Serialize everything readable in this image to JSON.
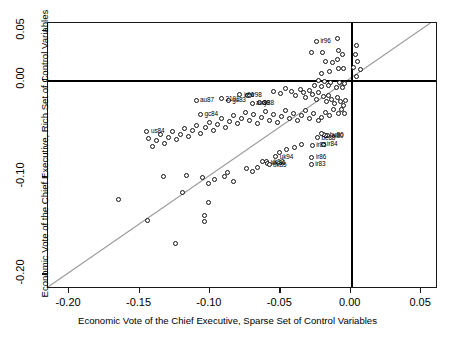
{
  "chart_data": {
    "type": "scatter",
    "title": "",
    "xlabel": "Economic Vote of the Chief Executive, Sparse Set of Control Variables",
    "ylabel": "Economic Vote of the Chief Executive, Rich Set of Control Variables",
    "xlim": [
      -0.215,
      0.062
    ],
    "ylim": [
      -0.215,
      0.058
    ],
    "xticks": [
      -0.2,
      -0.15,
      -0.1,
      -0.05,
      0.0,
      0.05
    ],
    "xticklabels": [
      "-0.20",
      "-0.15",
      "-0.10",
      "-0.05",
      "0.00",
      "0.05"
    ],
    "yticks": [
      0.05,
      0.0,
      -0.1,
      -0.2
    ],
    "yticklabels": [
      "0.05",
      "0.00",
      "-0.10",
      "-0.20"
    ],
    "grid": false,
    "legend": null,
    "marker": "open-circle",
    "reference_lines": [
      {
        "name": "y-zero",
        "type": "horizontal",
        "value": 0.0,
        "style": "bold-black"
      },
      {
        "name": "x-zero",
        "type": "vertical",
        "value": 0.0,
        "style": "bold-black"
      },
      {
        "name": "identity",
        "type": "diagonal",
        "equation": "y = x",
        "style": "gray-thin"
      }
    ],
    "points": [
      {
        "x": -0.0243,
        "y": 0.0391,
        "label": "ir96"
      },
      {
        "x": -0.0275,
        "y": 0.0277,
        "label": ""
      },
      {
        "x": -0.0203,
        "y": 0.0277,
        "label": ""
      },
      {
        "x": -0.0182,
        "y": 0.0182,
        "label": ""
      },
      {
        "x": -0.0132,
        "y": 0.0178,
        "label": ""
      },
      {
        "x": -0.0153,
        "y": 0.0082,
        "label": ""
      },
      {
        "x": -0.0211,
        "y": 0.006,
        "label": ""
      },
      {
        "x": -0.0096,
        "y": 0.0422,
        "label": ""
      },
      {
        "x": -0.0089,
        "y": 0.0299,
        "label": ""
      },
      {
        "x": -0.006,
        "y": 0.0256,
        "label": ""
      },
      {
        "x": -0.0092,
        "y": 0.0205,
        "label": ""
      },
      {
        "x": -0.0085,
        "y": 0.0116,
        "label": ""
      },
      {
        "x": -0.005,
        "y": 0.0114,
        "label": ""
      },
      {
        "x": 0.0038,
        "y": 0.035,
        "label": ""
      },
      {
        "x": 0.0035,
        "y": 0.0258,
        "label": ""
      },
      {
        "x": 0.005,
        "y": 0.019,
        "label": ""
      },
      {
        "x": 0.0023,
        "y": 0.0128,
        "label": ""
      },
      {
        "x": 0.0068,
        "y": 0.0106,
        "label": ""
      },
      {
        "x": 0.0042,
        "y": 0.0035,
        "label": ""
      },
      {
        "x": -0.0232,
        "y": -0.0007,
        "label": ""
      },
      {
        "x": -0.0186,
        "y": -0.0022,
        "label": ""
      },
      {
        "x": -0.014,
        "y": -0.003,
        "label": ""
      },
      {
        "x": -0.0079,
        "y": -0.0026,
        "label": ""
      },
      {
        "x": -0.0043,
        "y": -0.0036,
        "label": ""
      },
      {
        "x": -0.0254,
        "y": -0.0062,
        "label": ""
      },
      {
        "x": -0.0204,
        "y": -0.0071,
        "label": ""
      },
      {
        "x": -0.0157,
        "y": -0.0059,
        "label": ""
      },
      {
        "x": -0.0104,
        "y": -0.0083,
        "label": ""
      },
      {
        "x": -0.0057,
        "y": -0.0079,
        "label": ""
      },
      {
        "x": -0.1098,
        "y": -0.0214,
        "label": "au87"
      },
      {
        "x": -0.0917,
        "y": -0.0195,
        "label": "2101"
      },
      {
        "x": -0.0869,
        "y": -0.0213,
        "label": "gc83"
      },
      {
        "x": -0.0787,
        "y": -0.0154,
        "label": "ir96"
      },
      {
        "x": -0.0733,
        "y": -0.0162,
        "label": "ir98"
      },
      {
        "x": -0.0722,
        "y": -0.0165,
        "label": ""
      },
      {
        "x": -0.0701,
        "y": -0.0244,
        "label": "au89"
      },
      {
        "x": -0.0645,
        "y": -0.0238,
        "label": "y88"
      },
      {
        "x": -0.0615,
        "y": -0.0232,
        "label": ""
      },
      {
        "x": -0.1067,
        "y": -0.0354,
        "label": "gc84"
      },
      {
        "x": -0.1447,
        "y": -0.0531,
        "label": "us84"
      },
      {
        "x": -0.0545,
        "y": -0.0118,
        "label": ""
      },
      {
        "x": -0.0496,
        "y": -0.0141,
        "label": ""
      },
      {
        "x": -0.0462,
        "y": -0.0097,
        "label": ""
      },
      {
        "x": -0.0423,
        "y": -0.012,
        "label": ""
      },
      {
        "x": -0.039,
        "y": -0.0162,
        "label": ""
      },
      {
        "x": -0.0358,
        "y": -0.0102,
        "label": ""
      },
      {
        "x": -0.0332,
        "y": -0.0138,
        "label": ""
      },
      {
        "x": -0.0318,
        "y": -0.0183,
        "label": ""
      },
      {
        "x": -0.0296,
        "y": -0.0117,
        "label": ""
      },
      {
        "x": -0.0268,
        "y": -0.0155,
        "label": ""
      },
      {
        "x": -0.0243,
        "y": -0.0201,
        "label": ""
      },
      {
        "x": -0.0228,
        "y": -0.0136,
        "label": ""
      },
      {
        "x": -0.0196,
        "y": -0.0178,
        "label": ""
      },
      {
        "x": -0.0174,
        "y": -0.0225,
        "label": ""
      },
      {
        "x": -0.0158,
        "y": -0.016,
        "label": ""
      },
      {
        "x": -0.0134,
        "y": -0.0203,
        "label": ""
      },
      {
        "x": -0.0112,
        "y": -0.0249,
        "label": ""
      },
      {
        "x": -0.0095,
        "y": -0.0187,
        "label": ""
      },
      {
        "x": -0.0073,
        "y": -0.0229,
        "label": ""
      },
      {
        "x": -0.0052,
        "y": -0.0271,
        "label": ""
      },
      {
        "x": -0.0035,
        "y": -0.0213,
        "label": ""
      },
      {
        "x": -0.012,
        "y": -0.031,
        "label": ""
      },
      {
        "x": -0.009,
        "y": -0.0348,
        "label": ""
      },
      {
        "x": -0.0063,
        "y": -0.0305,
        "label": ""
      },
      {
        "x": -0.0041,
        "y": -0.0345,
        "label": ""
      },
      {
        "x": -0.0153,
        "y": -0.0374,
        "label": ""
      },
      {
        "x": -0.0181,
        "y": -0.034,
        "label": ""
      },
      {
        "x": -0.0205,
        "y": -0.0386,
        "label": ""
      },
      {
        "x": -0.0232,
        "y": -0.042,
        "label": ""
      },
      {
        "x": -0.0266,
        "y": -0.0353,
        "label": ""
      },
      {
        "x": -0.0295,
        "y": -0.0397,
        "label": ""
      },
      {
        "x": -0.0322,
        "y": -0.0315,
        "label": ""
      },
      {
        "x": -0.035,
        "y": -0.0366,
        "label": ""
      },
      {
        "x": -0.0378,
        "y": -0.0425,
        "label": ""
      },
      {
        "x": -0.0408,
        "y": -0.0347,
        "label": ""
      },
      {
        "x": -0.0436,
        "y": -0.0402,
        "label": ""
      },
      {
        "x": -0.0464,
        "y": -0.0318,
        "label": ""
      },
      {
        "x": -0.049,
        "y": -0.0379,
        "label": ""
      },
      {
        "x": -0.0518,
        "y": -0.0438,
        "label": ""
      },
      {
        "x": -0.0548,
        "y": -0.0356,
        "label": ""
      },
      {
        "x": -0.0576,
        "y": -0.0416,
        "label": ""
      },
      {
        "x": -0.0604,
        "y": -0.0332,
        "label": ""
      },
      {
        "x": -0.0634,
        "y": -0.039,
        "label": ""
      },
      {
        "x": -0.0662,
        "y": -0.0448,
        "label": ""
      },
      {
        "x": -0.069,
        "y": -0.0364,
        "label": ""
      },
      {
        "x": -0.0718,
        "y": -0.0424,
        "label": ""
      },
      {
        "x": -0.0748,
        "y": -0.034,
        "label": ""
      },
      {
        "x": -0.0776,
        "y": -0.0398,
        "label": ""
      },
      {
        "x": -0.0806,
        "y": -0.0455,
        "label": ""
      },
      {
        "x": -0.0834,
        "y": -0.0372,
        "label": ""
      },
      {
        "x": -0.0862,
        "y": -0.043,
        "label": ""
      },
      {
        "x": -0.0892,
        "y": -0.0488,
        "label": ""
      },
      {
        "x": -0.092,
        "y": -0.0405,
        "label": ""
      },
      {
        "x": -0.0948,
        "y": -0.0462,
        "label": ""
      },
      {
        "x": -0.0978,
        "y": -0.052,
        "label": ""
      },
      {
        "x": -0.1006,
        "y": -0.0437,
        "label": ""
      },
      {
        "x": -0.1034,
        "y": -0.0495,
        "label": ""
      },
      {
        "x": -0.1064,
        "y": -0.0553,
        "label": ""
      },
      {
        "x": -0.1092,
        "y": -0.047,
        "label": ""
      },
      {
        "x": -0.1122,
        "y": -0.0528,
        "label": ""
      },
      {
        "x": -0.115,
        "y": -0.0586,
        "label": ""
      },
      {
        "x": -0.1178,
        "y": -0.0503,
        "label": ""
      },
      {
        "x": -0.1208,
        "y": -0.0561,
        "label": ""
      },
      {
        "x": -0.1236,
        "y": -0.0619,
        "label": ""
      },
      {
        "x": -0.1264,
        "y": -0.0536,
        "label": ""
      },
      {
        "x": -0.1294,
        "y": -0.0594,
        "label": ""
      },
      {
        "x": -0.1322,
        "y": -0.0652,
        "label": ""
      },
      {
        "x": -0.135,
        "y": -0.0569,
        "label": ""
      },
      {
        "x": -0.138,
        "y": -0.0627,
        "label": ""
      },
      {
        "x": -0.1408,
        "y": -0.0685,
        "label": ""
      },
      {
        "x": -0.1436,
        "y": -0.0602,
        "label": ""
      },
      {
        "x": -0.0236,
        "y": -0.0598,
        "label": "be88"
      },
      {
        "x": -0.0162,
        "y": -0.0576,
        "label": "nl80"
      },
      {
        "x": -0.0178,
        "y": -0.057,
        "label": "bu80"
      },
      {
        "x": -0.0196,
        "y": -0.0563,
        "label": ""
      },
      {
        "x": -0.0209,
        "y": -0.0556,
        "label": ""
      },
      {
        "x": -0.0274,
        "y": -0.0676,
        "label": "ir85"
      },
      {
        "x": -0.0196,
        "y": -0.0663,
        "label": "ir84"
      },
      {
        "x": -0.0275,
        "y": -0.08,
        "label": "ir86"
      },
      {
        "x": -0.0281,
        "y": -0.0871,
        "label": "ir83"
      },
      {
        "x": -0.0532,
        "y": -0.0795,
        "label": "uk94"
      },
      {
        "x": -0.0625,
        "y": -0.0838,
        "label": ""
      },
      {
        "x": -0.0597,
        "y": -0.0846,
        "label": "uk92"
      },
      {
        "x": -0.0588,
        "y": -0.086,
        "label": "uk86"
      },
      {
        "x": -0.058,
        "y": -0.0873,
        "label": "uk85"
      },
      {
        "x": -0.0835,
        "y": -0.1044,
        "label": ""
      },
      {
        "x": -0.0899,
        "y": -0.1,
        "label": ""
      },
      {
        "x": -0.0873,
        "y": -0.0958,
        "label": ""
      },
      {
        "x": -0.101,
        "y": -0.107,
        "label": ""
      },
      {
        "x": -0.0965,
        "y": -0.1023,
        "label": ""
      },
      {
        "x": -0.1055,
        "y": -0.1004,
        "label": ""
      },
      {
        "x": -0.1165,
        "y": -0.099,
        "label": ""
      },
      {
        "x": -0.133,
        "y": -0.0998,
        "label": ""
      },
      {
        "x": -0.1196,
        "y": -0.1163,
        "label": ""
      },
      {
        "x": -0.165,
        "y": -0.1232,
        "label": ""
      },
      {
        "x": -0.1443,
        "y": -0.1445,
        "label": ""
      },
      {
        "x": -0.1007,
        "y": -0.1265,
        "label": ""
      },
      {
        "x": -0.1035,
        "y": -0.1395,
        "label": ""
      },
      {
        "x": -0.1042,
        "y": -0.146,
        "label": ""
      },
      {
        "x": -0.1245,
        "y": -0.1682,
        "label": ""
      },
      {
        "x": -0.0698,
        "y": -0.0942,
        "label": ""
      },
      {
        "x": -0.0742,
        "y": -0.0912,
        "label": ""
      },
      {
        "x": -0.066,
        "y": -0.09,
        "label": ""
      },
      {
        "x": -0.0455,
        "y": -0.0718,
        "label": ""
      },
      {
        "x": -0.0503,
        "y": -0.0745,
        "label": ""
      },
      {
        "x": -0.0398,
        "y": -0.0702,
        "label": ""
      },
      {
        "x": -0.0352,
        "y": -0.067,
        "label": ""
      }
    ],
    "point_labels_visible": [
      "ir96",
      "au87",
      "2101",
      "gc83",
      "ir98",
      "au89",
      "y88",
      "gc84",
      "us84",
      "be88",
      "nl80",
      "bu80",
      "ir85",
      "ir84",
      "ir86",
      "ir83",
      "uk94",
      "uk92",
      "uk86",
      "uk85"
    ]
  },
  "style": {
    "point_stroke": "#111111",
    "point_fill": "#ffffff",
    "axis_color": "#1a1a1a",
    "zero_line_color": "#000000",
    "diagonal_color": "#999999",
    "background": "#ffffff"
  }
}
